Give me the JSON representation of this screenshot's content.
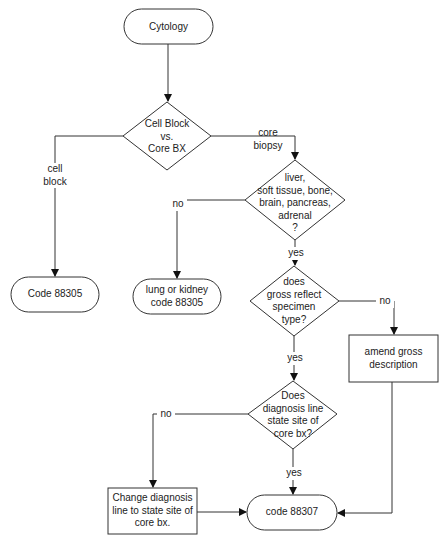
{
  "nodes": {
    "cytology": {
      "label": "Cytology",
      "shape": "terminator"
    },
    "decision_cellblock": {
      "label": "Cell Block\nvs.\nCore BX",
      "shape": "diamond"
    },
    "code_88305": {
      "label": "Code 88305",
      "shape": "terminator"
    },
    "decision_site": {
      "label": "liver,\nsoft tissue, bone,\nbrain, pancreas,\nadrenal\n?",
      "shape": "diamond"
    },
    "lung_kidney": {
      "label": "lung or kidney\ncode 88305",
      "shape": "terminator"
    },
    "decision_gross": {
      "label": "does\ngross reflect\nspecimen\ntype?",
      "shape": "diamond"
    },
    "amend_gross": {
      "label": "amend gross\ndescription",
      "shape": "process"
    },
    "decision_diagnosis": {
      "label": "Does\ndiagnosis line\nstate site of\ncore bx?",
      "shape": "diamond"
    },
    "change_diagnosis": {
      "label": "Change diagnosis\nline to state site of\ncore bx.",
      "shape": "process"
    },
    "code_88307": {
      "label": "code 88307",
      "shape": "terminator"
    }
  },
  "edges": {
    "cell_block": "cell\nblock",
    "core_biopsy": "core\nbiopsy",
    "site_no": "no",
    "site_yes": "yes",
    "gross_no": "no",
    "gross_yes": "yes",
    "diag_no": "no",
    "diag_yes": "yes"
  },
  "colors": {
    "stroke": "#333333",
    "text": "#222222",
    "background": "#ffffff"
  }
}
